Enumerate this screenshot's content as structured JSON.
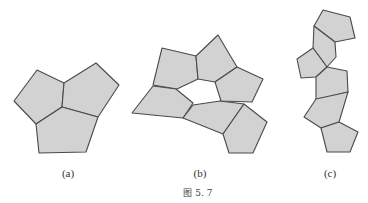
{
  "figure": {
    "caption": "图 5. 7",
    "fill_color": "#d2d2d2",
    "stroke_color": "#4a4a4a",
    "panels": [
      {
        "label": "(a)",
        "description": "three pentagons meeting at a single vertex",
        "pentagons": [
          "37,70 64,83 62,107 36,124 14,101",
          "64,83 96,63 119,85 98,117 62,107",
          "36,124 62,107 98,117 86,152 39,153"
        ]
      },
      {
        "label": "(b)",
        "description": "six pentagons forming a ring around a pentagonal hole",
        "pentagons": [
          "162,48 196,56 198,79 177,89 153,85",
          "196,56 218,35 237,67 215,82 198,79",
          "237,67 263,79 252,102 221,101 215,82",
          "153,86 176,89 193,103 183,118 132,113",
          "193,105 220,101 244,104 223,134 183,118",
          "244,104 267,122 253,153 229,153 223,134"
        ]
      },
      {
        "label": "(c)",
        "description": "chain of seven pentagons arranged vertically",
        "pentagons": [
          "323,10 350,17 355,38 335,42 314,26",
          "314,26 335,42 336,57 327,67 313,48",
          "313,48 327,67 316,77 301,78 297,59",
          "327,67 347,71 348,92 316,100 316,77",
          "316,99 348,92 339,122 321,128 304,117",
          "321,128 339,122 358,132 350,152 327,152"
        ]
      }
    ]
  }
}
